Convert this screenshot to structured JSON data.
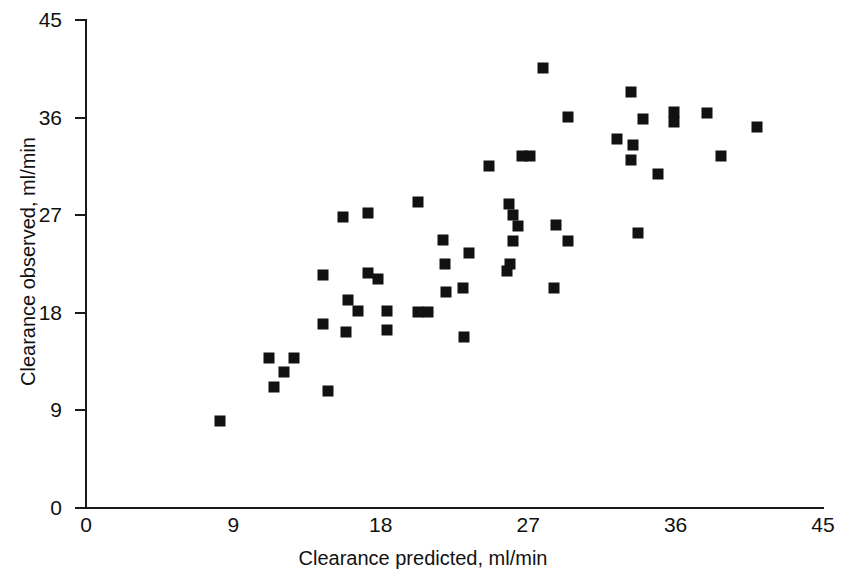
{
  "chart_data": {
    "type": "scatter",
    "title": "",
    "xlabel": "Clearance predicted, ml/min",
    "ylabel": "Clearance observed, ml/min",
    "xlim": [
      0,
      45
    ],
    "ylim": [
      0,
      45
    ],
    "xticks": [
      "0",
      "9",
      "18",
      "27",
      "36",
      "45"
    ],
    "yticks": [
      "0",
      "9",
      "18",
      "27",
      "36",
      "45"
    ],
    "xtick_values": [
      0,
      9,
      18,
      27,
      36,
      45
    ],
    "ytick_values": [
      0,
      9,
      18,
      27,
      36,
      45
    ],
    "grid": false,
    "legend": false,
    "marker": "filled-square",
    "marker_color": "#111111",
    "series": [
      {
        "name": "Clearance",
        "points": [
          [
            8.2,
            8.0
          ],
          [
            11.2,
            13.8
          ],
          [
            11.5,
            11.2
          ],
          [
            12.7,
            13.8
          ],
          [
            12.1,
            12.5
          ],
          [
            14.8,
            10.8
          ],
          [
            14.5,
            17.0
          ],
          [
            14.5,
            21.5
          ],
          [
            15.7,
            26.8
          ],
          [
            16.0,
            19.2
          ],
          [
            15.9,
            16.2
          ],
          [
            17.2,
            27.2
          ],
          [
            16.6,
            18.2
          ],
          [
            17.2,
            21.7
          ],
          [
            17.8,
            21.1
          ],
          [
            18.4,
            18.2
          ],
          [
            18.4,
            16.4
          ],
          [
            20.3,
            18.1
          ],
          [
            20.9,
            18.1
          ],
          [
            20.3,
            28.2
          ],
          [
            21.8,
            24.7
          ],
          [
            21.9,
            22.5
          ],
          [
            23.4,
            23.5
          ],
          [
            22.0,
            19.9
          ],
          [
            23.0,
            20.3
          ],
          [
            23.1,
            15.8
          ],
          [
            24.6,
            31.5
          ],
          [
            25.8,
            28.0
          ],
          [
            26.1,
            24.6
          ],
          [
            25.7,
            21.9
          ],
          [
            26.1,
            27.0
          ],
          [
            26.4,
            26.0
          ],
          [
            26.6,
            32.5
          ],
          [
            27.1,
            32.5
          ],
          [
            25.9,
            22.5
          ],
          [
            27.9,
            40.6
          ],
          [
            28.7,
            26.1
          ],
          [
            28.6,
            20.3
          ],
          [
            29.4,
            24.6
          ],
          [
            29.4,
            36.1
          ],
          [
            32.4,
            34.0
          ],
          [
            33.4,
            33.5
          ],
          [
            33.3,
            38.4
          ],
          [
            33.3,
            32.1
          ],
          [
            34.0,
            35.9
          ],
          [
            34.9,
            30.8
          ],
          [
            33.7,
            25.4
          ],
          [
            35.9,
            36.5
          ],
          [
            35.9,
            35.6
          ],
          [
            37.9,
            36.4
          ],
          [
            38.8,
            32.5
          ],
          [
            41.0,
            35.1
          ]
        ]
      }
    ]
  }
}
